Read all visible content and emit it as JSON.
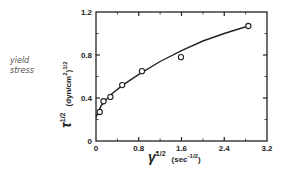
{
  "annotation": {
    "line1": "yield",
    "line2": "stress"
  },
  "chart_data": {
    "type": "scatter",
    "title": "",
    "xlabel": "γ̇^(1/2) (sec^-1/2)",
    "ylabel": "τ^(1/2) (dyn/cm²)^(1/2)",
    "xlabel_parts": {
      "symbol": "γ̇",
      "exp": "1/2",
      "unit": "(sec",
      "unit_exp": "-1/2",
      "close": ")"
    },
    "ylabel_parts": {
      "symbol": "τ",
      "exp": "1/2",
      "unit": "(dyn/cm",
      "unit_sup": "2",
      "close": ")",
      "close_exp": "1/2"
    },
    "xlim": [
      0,
      3.2
    ],
    "ylim": [
      0,
      1.2
    ],
    "x_ticks": [
      "0",
      "0.8",
      "1.6",
      "2.4",
      "3.2"
    ],
    "y_ticks": [
      "0",
      "0.4",
      "0.8",
      "1.2"
    ],
    "grid": false,
    "legend": null,
    "series": [
      {
        "name": "measured",
        "marker": "open-circle",
        "x": [
          0.07,
          0.14,
          0.27,
          0.49,
          0.86,
          1.59,
          2.85
        ],
        "y": [
          0.27,
          0.37,
          0.41,
          0.52,
          0.65,
          0.78,
          1.07
        ]
      },
      {
        "name": "fit",
        "marker": "line",
        "x": [
          0.0,
          0.05,
          0.1,
          0.2,
          0.3,
          0.5,
          0.8,
          1.2,
          1.6,
          2.0,
          2.4,
          2.85
        ],
        "y": [
          0.22,
          0.28,
          0.33,
          0.39,
          0.44,
          0.52,
          0.62,
          0.74,
          0.84,
          0.93,
          1.0,
          1.07
        ]
      }
    ]
  }
}
